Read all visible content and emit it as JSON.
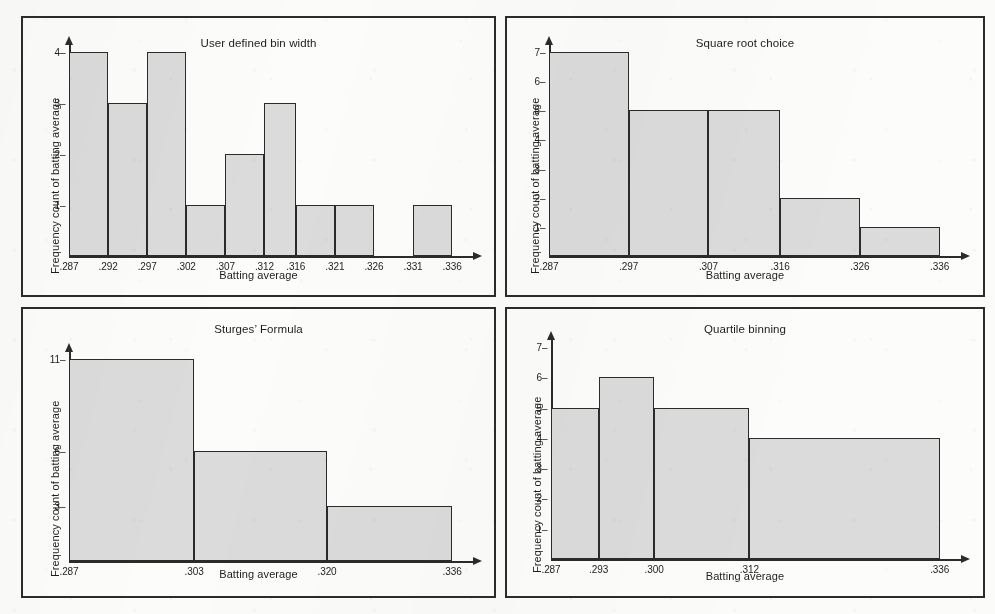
{
  "figure": {
    "background_color": "#fbfbfa",
    "bar_fill_color": "#dbdbdb",
    "line_color": "#2b2b2b"
  },
  "chart_data": [
    {
      "type": "bar",
      "panel": "top-left",
      "title": "User defined bin width",
      "xlabel": "Batting average",
      "ylabel": "Frequency count of batting average",
      "grid": false,
      "legend": "none",
      "xtick_labels": [
        ".287",
        ".292",
        ".297",
        ".302",
        ".307",
        ".312",
        ".316",
        ".321",
        ".326",
        ".331",
        ".336"
      ],
      "xtick_values": [
        0.287,
        0.292,
        0.297,
        0.302,
        0.307,
        0.312,
        0.316,
        0.321,
        0.326,
        0.331,
        0.336
      ],
      "ytick_labels": [
        "1",
        "2",
        "3",
        "4"
      ],
      "ytick_values": [
        1,
        2,
        3,
        4
      ],
      "xlim": [
        0.287,
        0.336
      ],
      "ylim": [
        0,
        4
      ],
      "bin_edges": [
        0.287,
        0.292,
        0.297,
        0.302,
        0.307,
        0.312,
        0.316,
        0.321,
        0.326,
        0.331,
        0.336
      ],
      "categories": [
        ".287–.292",
        ".292–.297",
        ".297–.302",
        ".302–.307",
        ".307–.312",
        ".312–.316",
        ".316–.321",
        ".321–.326",
        ".326–.331",
        ".331–.336"
      ],
      "values": [
        4,
        3,
        4,
        1,
        2,
        3,
        1,
        1,
        0,
        1
      ]
    },
    {
      "type": "bar",
      "panel": "top-right",
      "title": "Square root choice",
      "xlabel": "Batting average",
      "ylabel": "Frequency count of batting average",
      "grid": false,
      "legend": "none",
      "xtick_labels": [
        ".287",
        ".297",
        ".307",
        ".316",
        ".326",
        ".336"
      ],
      "xtick_values": [
        0.287,
        0.297,
        0.307,
        0.316,
        0.326,
        0.336
      ],
      "ytick_labels": [
        "1",
        "2",
        "3",
        "4",
        "5",
        "6",
        "7"
      ],
      "ytick_values": [
        1,
        2,
        3,
        4,
        5,
        6,
        7
      ],
      "xlim": [
        0.287,
        0.336
      ],
      "ylim": [
        0,
        7
      ],
      "bin_edges": [
        0.287,
        0.297,
        0.307,
        0.316,
        0.326,
        0.336
      ],
      "categories": [
        ".287–.297",
        ".297–.307",
        ".307–.316",
        ".316–.326",
        ".326–.336"
      ],
      "values": [
        7,
        5,
        5,
        2,
        1
      ]
    },
    {
      "type": "bar",
      "panel": "bottom-left",
      "title": "Sturges’ Formula",
      "xlabel": "Batting average",
      "ylabel": "Frequency count of batting average",
      "grid": false,
      "legend": "none",
      "xtick_labels": [
        ".287",
        ".303",
        ".320",
        ".336"
      ],
      "xtick_values": [
        0.287,
        0.303,
        0.32,
        0.336
      ],
      "ytick_labels": [
        "3",
        "6",
        "11"
      ],
      "ytick_values": [
        3,
        6,
        11
      ],
      "xlim": [
        0.287,
        0.336
      ],
      "ylim": [
        0,
        11
      ],
      "bin_edges": [
        0.287,
        0.303,
        0.32,
        0.336
      ],
      "categories": [
        ".287–.303",
        ".303–.320",
        ".320–.336"
      ],
      "values": [
        11,
        6,
        3
      ]
    },
    {
      "type": "bar",
      "panel": "bottom-right",
      "title": "Quartile binning",
      "xlabel": "Batting average",
      "ylabel": "Frequency count of batting average",
      "grid": false,
      "legend": "none",
      "xtick_labels": [
        ".287",
        ".293",
        ".300",
        ".312",
        ".336"
      ],
      "xtick_values": [
        0.287,
        0.293,
        0.3,
        0.312,
        0.336
      ],
      "ytick_labels": [
        "1",
        "2",
        "3",
        "4",
        "5",
        "6",
        "7"
      ],
      "ytick_values": [
        1,
        2,
        3,
        4,
        5,
        6,
        7
      ],
      "xlim": [
        0.287,
        0.336
      ],
      "ylim": [
        0,
        7
      ],
      "bin_edges": [
        0.287,
        0.293,
        0.3,
        0.312,
        0.336
      ],
      "categories": [
        ".287–.293",
        ".293–.300",
        ".300–.312",
        ".312–.336"
      ],
      "values": [
        5,
        6,
        5,
        4
      ]
    }
  ]
}
